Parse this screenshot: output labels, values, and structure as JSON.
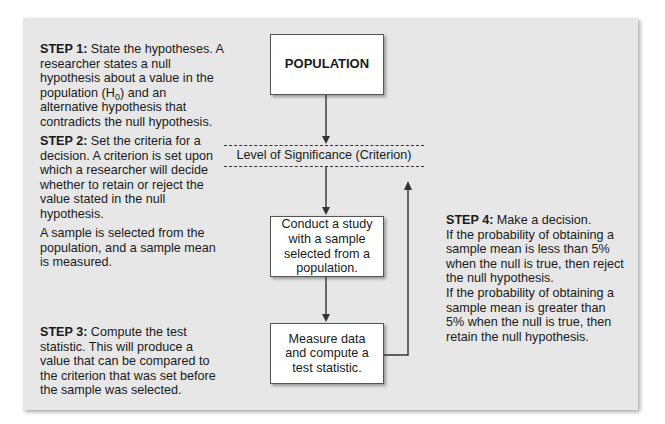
{
  "left_column": {
    "step1": {
      "label": "STEP 1:",
      "text_a": " State the hypotheses. A researcher states a null hypothesis about a value in the population (H",
      "subscript": "0",
      "text_b": ") and an alternative hypothesis that contradicts the null hypothesis."
    },
    "step2": {
      "label": "STEP 2:",
      "text": " Set the criteria for a decision. A criterion is set upon which a researcher will decide whether to retain or reject the value stated in the null hypothesis."
    },
    "sample_note": "A sample is selected from the population, and a sample mean is measured.",
    "step3": {
      "label": "STEP 3:",
      "text": " Compute the test statistic. This will produce a value that can be compared to the criterion that was set before the sample was selected."
    }
  },
  "flowchart": {
    "population_box": "POPULATION",
    "criterion_label": "Level of Significance (Criterion)",
    "study_box": "Conduct a study with a sample selected from a population.",
    "measure_box": "Measure data and compute a test statistic."
  },
  "right_column": {
    "step4": {
      "label": "STEP 4:",
      "text": " Make a decision.",
      "line_reject": "If the probability of obtaining a sample mean is less than 5% when the null is true, then reject the null hypothesis.",
      "line_retain": "If the probability of obtaining a sample mean is greater than 5% when the null is true, then retain the null hypothesis."
    }
  },
  "colors": {
    "panel_bg": "#e7e7e7",
    "box_bg": "#ffffff",
    "line": "#333333"
  }
}
